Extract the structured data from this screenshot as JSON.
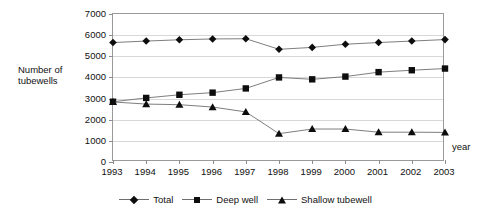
{
  "chart_data": {
    "type": "line",
    "title": "",
    "xlabel": "year",
    "ylabel": "Number of tubewells",
    "ylim": [
      0,
      7000
    ],
    "ytick_step": 1000,
    "grid": true,
    "legend_position": "bottom",
    "categories": [
      "1993",
      "1994",
      "1995",
      "1996",
      "1997",
      "1998",
      "1999",
      "2000",
      "2001",
      "2002",
      "2003"
    ],
    "ytick_labels": [
      "7000",
      "6000",
      "5000",
      "4000",
      "3000",
      "2000",
      "1000",
      "0"
    ],
    "series": [
      {
        "name": "Total",
        "marker": "diamond",
        "values": [
          5650,
          5720,
          5780,
          5820,
          5830,
          5330,
          5420,
          5570,
          5650,
          5720,
          5790
        ]
      },
      {
        "name": "Deep well",
        "marker": "square",
        "values": [
          2850,
          3030,
          3180,
          3280,
          3480,
          4000,
          3910,
          4040,
          4250,
          4340,
          4420
        ]
      },
      {
        "name": "Shallow tubewell",
        "marker": "triangle",
        "values": [
          2840,
          2740,
          2710,
          2600,
          2370,
          1340,
          1560,
          1560,
          1410,
          1410,
          1400
        ]
      }
    ],
    "colors": {
      "marker": "#0d0d0d",
      "line": "#6f6f6f",
      "grid": "#d8d8d8",
      "axis": "#9a9a9a"
    }
  }
}
